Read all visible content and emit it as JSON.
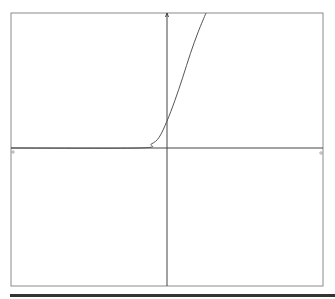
{
  "chart_data": {
    "type": "line",
    "title": "",
    "xlabel": "",
    "ylabel": "",
    "grid": false,
    "legend": null,
    "series": [
      {
        "name": "curve",
        "description": "zero for x<=~-0.18, then rises steeply (convex, polynomial/exponential-like) past the top of the frame near x≈0.25",
        "points": [
          [
            -1.0,
            0.0
          ],
          [
            -0.18,
            0.0
          ],
          [
            -0.1,
            0.03
          ],
          [
            -0.05,
            0.08
          ],
          [
            0.0,
            0.2
          ],
          [
            0.05,
            0.35
          ],
          [
            0.1,
            0.52
          ],
          [
            0.15,
            0.7
          ],
          [
            0.2,
            0.86
          ],
          [
            0.25,
            1.0
          ]
        ]
      }
    ],
    "xlim": [
      -1,
      1
    ],
    "ylim": [
      -1,
      1
    ],
    "axes": {
      "x_axis_at_y": 0,
      "y_axis_at_x": 0
    },
    "colors": {
      "curve": "#555555",
      "axes": "#444444",
      "frame": "#888888"
    }
  }
}
